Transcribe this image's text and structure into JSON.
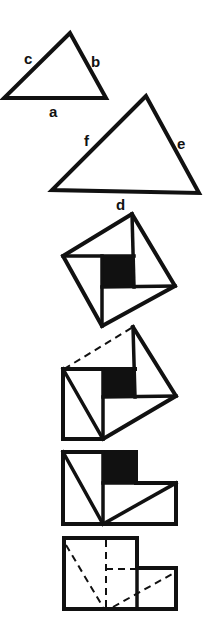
{
  "figure": {
    "triangle_small": {
      "labels": {
        "side_bottom": "a",
        "side_right": "b",
        "side_left": "c"
      }
    },
    "triangle_large": {
      "labels": {
        "side_bottom": "d",
        "side_right": "e",
        "side_left": "f"
      }
    },
    "panels": [
      {
        "id": "tilted-square",
        "caption": ""
      },
      {
        "id": "square-partially-unfolded",
        "caption": ""
      },
      {
        "id": "rearranged-pieces",
        "caption": ""
      },
      {
        "id": "two-squares-dashed",
        "caption": ""
      }
    ],
    "colors": {
      "ink": "#111111",
      "background": "#ffffff"
    }
  }
}
